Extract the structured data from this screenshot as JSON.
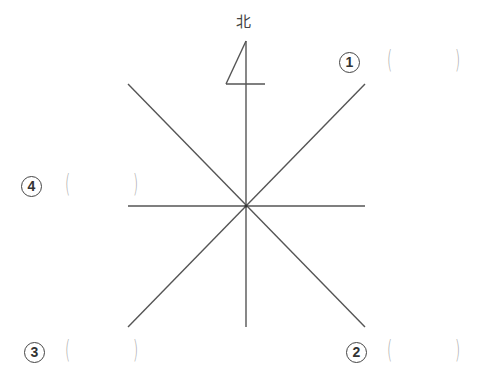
{
  "compass": {
    "north_label": "北",
    "center": [
      246,
      206
    ],
    "line_color": "#555555",
    "lines": [
      {
        "name": "north-south",
        "x1": 246,
        "y1": 41,
        "x2": 246,
        "y2": 327
      },
      {
        "name": "west-east",
        "x1": 128,
        "y1": 206,
        "x2": 365,
        "y2": 206
      },
      {
        "name": "northwest-southeast",
        "x1": 128,
        "y1": 84,
        "x2": 365,
        "y2": 327
      },
      {
        "name": "southwest-northeast",
        "x1": 128,
        "y1": 327,
        "x2": 365,
        "y2": 84
      }
    ],
    "north_arrow": {
      "diagonal": [
        246,
        41,
        226,
        84
      ],
      "base": [
        226,
        84,
        265,
        84
      ]
    }
  },
  "questions": [
    {
      "number": "1",
      "label": "①",
      "direction": "northeast",
      "answer": "",
      "open_paren": "(",
      "close_paren": ")"
    },
    {
      "number": "2",
      "label": "②",
      "direction": "southeast",
      "answer": "",
      "open_paren": "(",
      "close_paren": ")"
    },
    {
      "number": "3",
      "label": "③",
      "direction": "southwest",
      "answer": "",
      "open_paren": "(",
      "close_paren": ")"
    },
    {
      "number": "4",
      "label": "④",
      "direction": "northwest",
      "answer": "",
      "open_paren": "(",
      "close_paren": ")"
    }
  ]
}
